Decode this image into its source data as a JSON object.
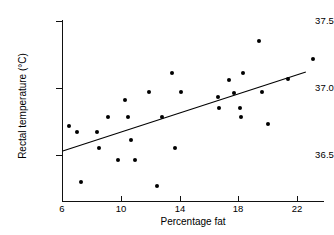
{
  "chart_data": {
    "type": "scatter",
    "title": "",
    "xlabel": "Percentage fat",
    "ylabel": "Rectal temperature (°C)",
    "xlim": [
      5.1,
      23.9
    ],
    "ylim": [
      36.28,
      37.5
    ],
    "xticks": [
      6,
      10,
      14,
      18,
      22
    ],
    "xticklabels": [
      "6",
      "10",
      "14",
      "18",
      "22"
    ],
    "yticks": [
      36.5,
      37.0,
      37.5
    ],
    "yticklabels": [
      "36.5",
      "37.0",
      "37.5"
    ],
    "grid": false,
    "legend": null,
    "marker": "filled-circle",
    "marker_color": "#000000",
    "points": [
      {
        "x": 6.5,
        "y": 36.72
      },
      {
        "x": 7.0,
        "y": 36.67
      },
      {
        "x": 7.3,
        "y": 36.3
      },
      {
        "x": 8.4,
        "y": 36.67
      },
      {
        "x": 8.5,
        "y": 36.55
      },
      {
        "x": 9.1,
        "y": 36.78
      },
      {
        "x": 9.8,
        "y": 36.46
      },
      {
        "x": 10.3,
        "y": 36.91
      },
      {
        "x": 10.5,
        "y": 36.78
      },
      {
        "x": 10.7,
        "y": 36.61
      },
      {
        "x": 11.0,
        "y": 36.46
      },
      {
        "x": 11.9,
        "y": 36.97
      },
      {
        "x": 12.5,
        "y": 36.27
      },
      {
        "x": 12.8,
        "y": 36.78
      },
      {
        "x": 13.5,
        "y": 37.11
      },
      {
        "x": 13.7,
        "y": 36.55
      },
      {
        "x": 14.1,
        "y": 36.97
      },
      {
        "x": 16.6,
        "y": 36.93
      },
      {
        "x": 16.7,
        "y": 36.85
      },
      {
        "x": 17.4,
        "y": 37.06
      },
      {
        "x": 17.7,
        "y": 36.96
      },
      {
        "x": 18.1,
        "y": 36.85
      },
      {
        "x": 18.2,
        "y": 36.78
      },
      {
        "x": 18.3,
        "y": 37.11
      },
      {
        "x": 19.4,
        "y": 37.35
      },
      {
        "x": 19.6,
        "y": 36.97
      },
      {
        "x": 20.0,
        "y": 36.73
      },
      {
        "x": 21.4,
        "y": 37.07
      },
      {
        "x": 23.1,
        "y": 37.22
      }
    ],
    "fit_line": {
      "type": "linear-regression",
      "x_start": 6.05,
      "y_start": 36.53,
      "x_end": 22.6,
      "y_end": 37.12
    }
  }
}
